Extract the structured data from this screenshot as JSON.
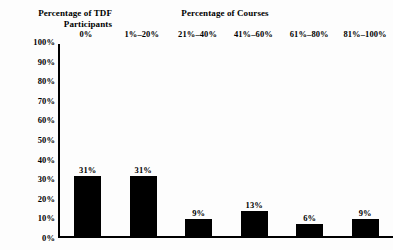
{
  "chart_data": {
    "type": "bar",
    "title": "Percentage of Courses",
    "xlabel": "Percentage of Courses",
    "ylabel": "Percentage of TDF Participants",
    "ylabel_lines": [
      "Percentage of TDF",
      "Participants"
    ],
    "categories": [
      "0%",
      "1%–20%",
      "21%–40%",
      "41%–60%",
      "61%–80%",
      "81%–100%"
    ],
    "values": [
      31,
      31,
      9,
      13,
      6,
      9
    ],
    "value_labels": [
      "31%",
      "31%",
      "9%",
      "13%",
      "6%",
      "9%"
    ],
    "ylim": [
      0,
      100
    ],
    "ytick_labels": [
      "100%",
      "90%",
      "80%",
      "70%",
      "60%",
      "50%",
      "40%",
      "30%",
      "20%",
      "10%",
      "0%"
    ],
    "ytick_values": [
      100,
      90,
      80,
      70,
      60,
      50,
      40,
      30,
      20,
      10,
      0
    ],
    "grid": false,
    "legend": "none",
    "bar_color": "#000000",
    "axis_color": "#000000",
    "background_color": "#fdfdfd",
    "category_labels_position": "top"
  }
}
